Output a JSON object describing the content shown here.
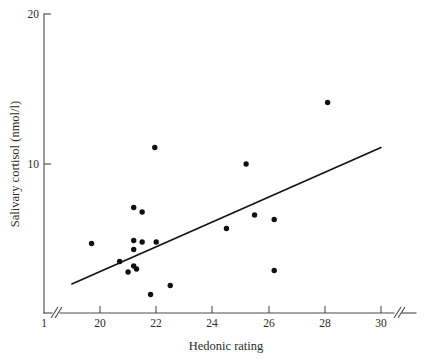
{
  "chart_data": {
    "type": "scatter",
    "title": "",
    "xlabel": "Hedonic rating",
    "ylabel": "Salivary cortisol (nmol/l)",
    "xlim": [
      19.0,
      31.0
    ],
    "ylim": [
      1.0,
      20.0
    ],
    "x_ticks": [
      20,
      22,
      24,
      26,
      28,
      30
    ],
    "x_tick_labels": [
      "20",
      "22",
      "24",
      "26",
      "28",
      "30"
    ],
    "x_origin_label": "1",
    "x_axis_break": true,
    "y_ticks": [
      10,
      20
    ],
    "y_tick_labels": [
      "10",
      "20"
    ],
    "y_axis_start_label": "1",
    "grid": false,
    "legend": false,
    "points": [
      {
        "x": 19.7,
        "y": 4.7
      },
      {
        "x": 20.7,
        "y": 3.5
      },
      {
        "x": 21.0,
        "y": 2.8
      },
      {
        "x": 21.2,
        "y": 7.1
      },
      {
        "x": 21.2,
        "y": 4.9
      },
      {
        "x": 21.2,
        "y": 4.3
      },
      {
        "x": 21.2,
        "y": 3.2
      },
      {
        "x": 21.3,
        "y": 3.0
      },
      {
        "x": 21.5,
        "y": 6.8
      },
      {
        "x": 21.5,
        "y": 4.8
      },
      {
        "x": 21.8,
        "y": 1.3
      },
      {
        "x": 21.95,
        "y": 11.1
      },
      {
        "x": 22.0,
        "y": 4.8
      },
      {
        "x": 22.5,
        "y": 1.9
      },
      {
        "x": 24.5,
        "y": 5.7
      },
      {
        "x": 25.2,
        "y": 10.0
      },
      {
        "x": 25.5,
        "y": 6.6
      },
      {
        "x": 26.2,
        "y": 6.3
      },
      {
        "x": 26.2,
        "y": 2.9
      },
      {
        "x": 28.1,
        "y": 14.1
      }
    ],
    "fit_line": {
      "x_start": 19.0,
      "y_start": 2.0,
      "x_end": 30.0,
      "y_end": 11.1
    }
  },
  "axes": {
    "y_label": "Salivary cortisol (nmol/l)",
    "x_label": "Hedonic rating",
    "y_tick_20": "20",
    "y_tick_10": "10",
    "x_tick_1": "1",
    "x_tick_20": "20",
    "x_tick_22": "22",
    "x_tick_24": "24",
    "x_tick_26": "26",
    "x_tick_28": "28",
    "x_tick_30": "30"
  }
}
